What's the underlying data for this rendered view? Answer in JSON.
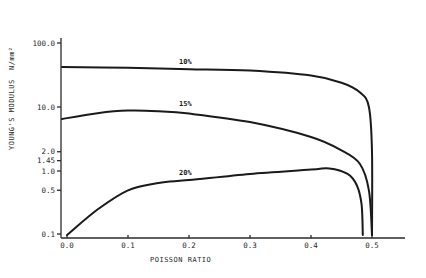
{
  "chart_data": {
    "type": "line",
    "title": "",
    "xlabel": "POISSON RATIO",
    "ylabel": "YOUNG'S MODULUS  N/mm²",
    "ylabel_main": "YOUNG'S MODULUS",
    "ylabel_unit": "N/mm²",
    "yscale": "log",
    "xlim": [
      0.0,
      0.55
    ],
    "ylim": [
      0.1,
      100.0
    ],
    "grid": false,
    "legend": "inline labels on curves",
    "x_ticks": [
      "0.0",
      "0.1",
      "0.2",
      "0.3",
      "0.4",
      "0.5"
    ],
    "y_ticks": [
      "100.0",
      "10.0",
      "2.0",
      "1.45",
      "1.0",
      "0.5",
      "0.1"
    ],
    "series": [
      {
        "name": "10%",
        "x": [
          0.0,
          0.1,
          0.2,
          0.3,
          0.4,
          0.45,
          0.48,
          0.495,
          0.5,
          0.5
        ],
        "y": [
          42,
          41,
          39,
          37,
          31,
          24,
          17,
          10,
          2,
          0.1
        ]
      },
      {
        "name": "15%",
        "x": [
          0.0,
          0.05,
          0.1,
          0.15,
          0.2,
          0.3,
          0.4,
          0.45,
          0.48,
          0.495,
          0.5
        ],
        "y": [
          6.5,
          8.0,
          8.8,
          8.6,
          7.9,
          5.8,
          3.4,
          2.1,
          1.3,
          0.5,
          0.1
        ]
      },
      {
        "name": "20%",
        "x": [
          0.0,
          0.05,
          0.1,
          0.15,
          0.2,
          0.3,
          0.4,
          0.43,
          0.46,
          0.475,
          0.483,
          0.485
        ],
        "y": [
          0.1,
          0.25,
          0.5,
          0.65,
          0.72,
          0.9,
          1.05,
          1.1,
          0.9,
          0.6,
          0.3,
          0.1
        ]
      }
    ],
    "annotations": [
      {
        "text": "10%",
        "x": 0.2,
        "y": 44
      },
      {
        "text": "15%",
        "x": 0.2,
        "y": 9.5
      },
      {
        "text": "20%",
        "x": 0.2,
        "y": 0.8
      }
    ]
  }
}
